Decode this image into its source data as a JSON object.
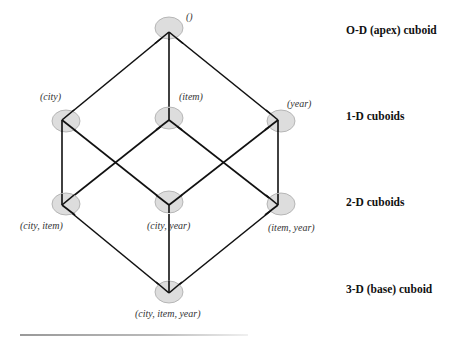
{
  "diagram": {
    "type": "lattice-of-cuboids",
    "colors": {
      "node_fill": "#d9d9d9",
      "node_stroke": "#a0a0a0",
      "edge": "#111111"
    },
    "nodes": [
      {
        "id": "apex",
        "label": "()",
        "level": 0,
        "x": 169,
        "y": 32
      },
      {
        "id": "city",
        "label": "(city)",
        "level": 1,
        "x": 62,
        "y": 120
      },
      {
        "id": "item",
        "label": "(item)",
        "level": 1,
        "x": 169,
        "y": 120
      },
      {
        "id": "year",
        "label": "(year)",
        "level": 1,
        "x": 278,
        "y": 120
      },
      {
        "id": "city_item",
        "label": "(city, item)",
        "level": 2,
        "x": 62,
        "y": 205
      },
      {
        "id": "city_year",
        "label": "(city, year)",
        "level": 2,
        "x": 169,
        "y": 205
      },
      {
        "id": "item_year",
        "label": "(item, year)",
        "level": 2,
        "x": 278,
        "y": 205
      },
      {
        "id": "base",
        "label": "(city, item, year)",
        "level": 3,
        "x": 169,
        "y": 293
      }
    ],
    "edges": [
      [
        "apex",
        "city"
      ],
      [
        "apex",
        "item"
      ],
      [
        "apex",
        "year"
      ],
      [
        "city",
        "city_item"
      ],
      [
        "city",
        "city_year"
      ],
      [
        "item",
        "city_item"
      ],
      [
        "item",
        "item_year"
      ],
      [
        "year",
        "city_year"
      ],
      [
        "year",
        "item_year"
      ],
      [
        "city_item",
        "base"
      ],
      [
        "city_year",
        "base"
      ],
      [
        "item_year",
        "base"
      ]
    ],
    "levels": [
      {
        "label": "O-D (apex) cuboid"
      },
      {
        "label": "1-D cuboids"
      },
      {
        "label": "2-D cuboids"
      },
      {
        "label": "3-D  (base) cuboid"
      }
    ]
  }
}
